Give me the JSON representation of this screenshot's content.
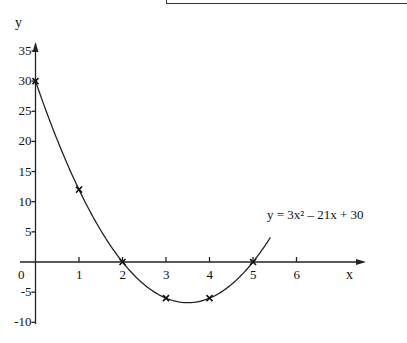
{
  "chart_data": {
    "type": "line",
    "title": "",
    "xlabel": "x",
    "ylabel": "y",
    "equation_label": "y = 3x² – 21x + 30",
    "x_ticks": [
      "1",
      "2",
      "3",
      "4",
      "5",
      "6"
    ],
    "y_ticks": [
      "35",
      "30",
      "25",
      "20",
      "15",
      "10",
      "5",
      "-5",
      "-10"
    ],
    "origin_label": "0",
    "xlim": [
      0,
      7
    ],
    "ylim": [
      -10,
      37
    ],
    "grid": false,
    "series": [
      {
        "name": "y = 3x² – 21x + 30",
        "marked_points": [
          {
            "x": 0,
            "y": 30
          },
          {
            "x": 1,
            "y": 12
          },
          {
            "x": 2,
            "y": 0
          },
          {
            "x": 3,
            "y": -6
          },
          {
            "x": 4,
            "y": -6
          },
          {
            "x": 5,
            "y": 0
          }
        ],
        "curve_x_range": [
          0,
          5.4
        ]
      }
    ]
  }
}
